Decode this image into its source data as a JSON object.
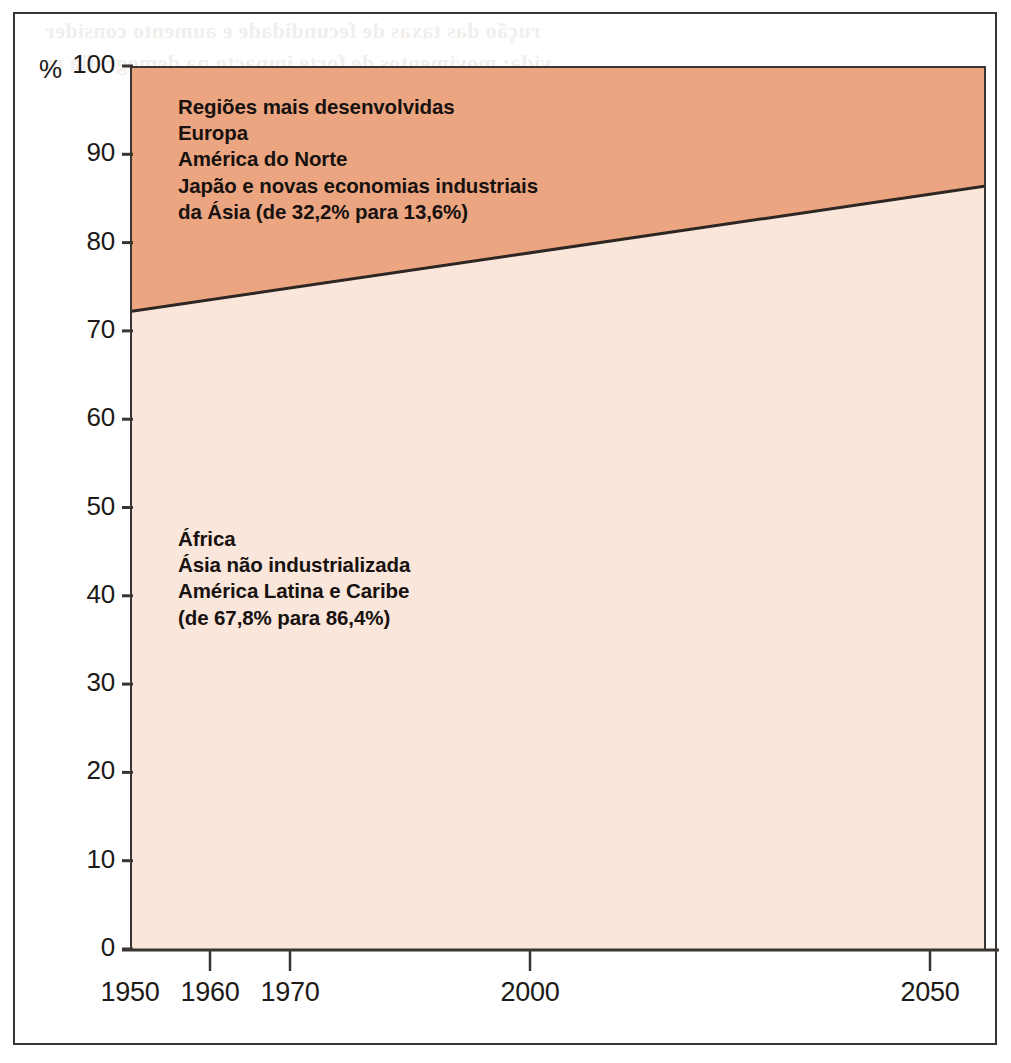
{
  "chart_data": {
    "type": "area",
    "title": "",
    "subtitle": "",
    "xlabel": "",
    "ylabel": "%",
    "unit_symbol": "%",
    "xlim": [
      1950,
      2057
    ],
    "ylim": [
      0,
      100
    ],
    "grid": false,
    "legend_position": "inside-plot-annotations",
    "stacked": true,
    "x_ticks": [
      {
        "value": 1950,
        "label": "1950"
      },
      {
        "value": 1960,
        "label": "1960"
      },
      {
        "value": 1970,
        "label": "1970"
      },
      {
        "value": 2000,
        "label": "2000"
      },
      {
        "value": 2050,
        "label": "2050"
      }
    ],
    "y_ticks": [
      {
        "value": 0,
        "label": "0"
      },
      {
        "value": 10,
        "label": "10"
      },
      {
        "value": 20,
        "label": "20"
      },
      {
        "value": 30,
        "label": "30"
      },
      {
        "value": 40,
        "label": "40"
      },
      {
        "value": 50,
        "label": "50"
      },
      {
        "value": 60,
        "label": "60"
      },
      {
        "value": 70,
        "label": "70"
      },
      {
        "value": 80,
        "label": "80"
      },
      {
        "value": 90,
        "label": "90"
      },
      {
        "value": 100,
        "label": "100"
      }
    ],
    "boundary_series": {
      "name": "fronteira-regioes",
      "x": [
        1950,
        2057
      ],
      "y": [
        72.2,
        86.4
      ],
      "description": "Share of world population in less developed regions (cumulative from bottom)"
    },
    "series": [
      {
        "name": "Regiões mais desenvolvidas",
        "color": "#eca581",
        "start_year": 1950,
        "end_year": 2050,
        "start_value": 32.2,
        "end_value": 13.6,
        "start_value_label": "32,2%",
        "end_value_label": "13,6%",
        "x": [
          1950,
          2057
        ],
        "values": [
          27.8,
          13.6
        ]
      },
      {
        "name": "Regiões menos desenvolvidas",
        "color": "#fae6db",
        "start_year": 1950,
        "end_year": 2050,
        "start_value": 67.8,
        "end_value": 86.4,
        "start_value_label": "67,8%",
        "end_value_label": "86,4%",
        "x": [
          1950,
          2057
        ],
        "values": [
          72.2,
          86.4
        ]
      }
    ],
    "annotations": [
      {
        "id": "developed",
        "region": "top",
        "lines": [
          "Regiões mais desenvolvidas",
          "Europa",
          "América do Norte",
          "Japão e novas economias industriais",
          "da Ásia (de 32,2% para 13,6%)"
        ],
        "text": "Regiões mais desenvolvidas\nEuropa\nAmérica do Norte\nJapão e novas economias industriais\nda Ásia (de 32,2% para 13,6%)"
      },
      {
        "id": "developing",
        "region": "bottom",
        "lines": [
          "África",
          "Ásia não industrializada",
          "América Latina e Caribe",
          "(de 67,8% para 86,4%)"
        ],
        "text": "África\nÁsia não industrializada\nAmérica Latina e Caribe\n(de 67,8% para 86,4%)"
      }
    ]
  },
  "colors": {
    "area_developed": "#eca581",
    "area_developing": "#fae6db",
    "boundary_line": "#2e2622",
    "axis": "#3b3532",
    "frame": "#3b3532",
    "text": "#17120f",
    "page_background": "#ffffff"
  },
  "bleed": {
    "heading_line_1": "rução das taxas de fecundidade e aumento consider",
    "heading_line_2": "vida: movimentos de forte impacto na demografia m",
    "heading_line_3": "undial",
    "table_caption": "Taxas de fecundidade",
    "col_1": "Menos de",
    "col_2": "Mundo",
    "col_3": "Regiões menos",
    "col_4": "Regiões",
    "col_5": "desenvolvidas",
    "rows": [
      "1950-55",
      "960-65",
      "1970-75",
      "980-85",
      "1990-95",
      "1995-00",
      "2000-05",
      "2010-15",
      "2020-25",
      "2045-50"
    ]
  }
}
